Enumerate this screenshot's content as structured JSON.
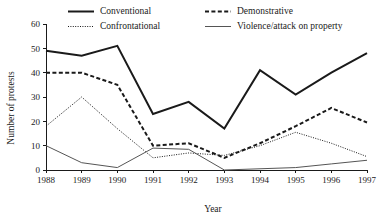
{
  "chart_data": {
    "type": "line",
    "title": "",
    "xlabel": "Year",
    "ylabel": "Number of protests",
    "categories": [
      "1988",
      "1989",
      "1990",
      "1991",
      "1992",
      "1993",
      "1994",
      "1995",
      "1996",
      "1997"
    ],
    "x": [
      1988,
      1989,
      1990,
      1991,
      1992,
      1993,
      1994,
      1995,
      1996,
      1997
    ],
    "xlim": [
      1988,
      1997
    ],
    "ylim": [
      0,
      60
    ],
    "yticks": [
      0,
      10,
      20,
      30,
      40,
      50,
      60
    ],
    "xticks": [
      "1988",
      "1989",
      "1990",
      "1991",
      "1992",
      "1993",
      "1994",
      "1995",
      "1996",
      "1997"
    ],
    "grid": false,
    "legend_position": "top",
    "series": [
      {
        "name": "Conventional",
        "style": "solid-thick",
        "color": "#1a1a1a",
        "values": [
          49,
          47,
          51,
          23,
          28,
          17,
          41,
          31,
          40,
          48
        ]
      },
      {
        "name": "Demonstrative",
        "style": "dashed-thick",
        "color": "#1a1a1a",
        "values": [
          40,
          40,
          35,
          10,
          11,
          5,
          11,
          18,
          25.5,
          19.5
        ]
      },
      {
        "name": "Confrontational",
        "style": "dotted-thin",
        "color": "#1a1a1a",
        "values": [
          18,
          30,
          17,
          5,
          7,
          6,
          10,
          15.5,
          11,
          5.5
        ]
      },
      {
        "name": "Violence/attack on property",
        "style": "solid-thin",
        "color": "#555555",
        "values": [
          10,
          3,
          1,
          9,
          8.5,
          0,
          0.5,
          1,
          2.5,
          4
        ]
      }
    ]
  },
  "legend": {
    "entries": [
      {
        "label": "Conventional"
      },
      {
        "label": "Demonstrative"
      },
      {
        "label": "Confrontational"
      },
      {
        "label": "Violence/attack on property"
      }
    ]
  },
  "axes": {
    "x_title": "Year",
    "y_title": "Number of protests"
  }
}
